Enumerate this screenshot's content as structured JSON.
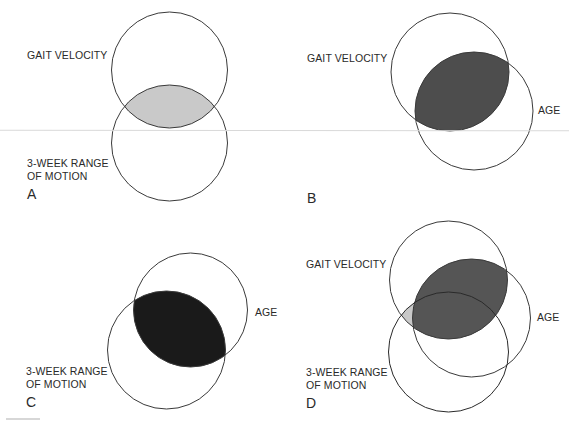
{
  "figure": {
    "panels": [
      {
        "id": "A",
        "letter": "A",
        "labels": {
          "top": "GAIT VELOCITY",
          "bottom_line1": "3-WEEK RANGE",
          "bottom_line2": "OF MOTION"
        },
        "circles": [
          {
            "name": "gait-velocity",
            "cx": 169.5,
            "cy": 70,
            "r": 58
          },
          {
            "name": "3-week-range-of-motion",
            "cx": 169.5,
            "cy": 143,
            "r": 58
          }
        ],
        "shaded_region": "gait-velocity ∩ 3-week-range-of-motion",
        "shade_color": "#c9c9c9"
      },
      {
        "id": "B",
        "letter": "B",
        "labels": {
          "top": "GAIT VELOCITY",
          "right": "AGE"
        },
        "circles": [
          {
            "name": "gait-velocity",
            "cx": 450,
            "cy": 72,
            "r": 59
          },
          {
            "name": "age",
            "cx": 474,
            "cy": 111,
            "r": 59
          }
        ],
        "shaded_region": "gait-velocity ∩ age",
        "shade_color": "#4d4d4d"
      },
      {
        "id": "C",
        "letter": "C",
        "labels": {
          "right": "AGE",
          "bottom_line1": "3-WEEK RANGE",
          "bottom_line2": "OF MOTION"
        },
        "circles": [
          {
            "name": "age",
            "cx": 190.5,
            "cy": 310,
            "r": 57
          },
          {
            "name": "3-week-range-of-motion",
            "cx": 166.5,
            "cy": 350,
            "r": 59
          }
        ],
        "shaded_region": "age ∩ 3-week-range-of-motion",
        "shade_color": "#1a1a1a"
      },
      {
        "id": "D",
        "letter": "D",
        "labels": {
          "top": "GAIT VELOCITY",
          "right": "AGE",
          "bottom_line1": "3-WEEK RANGE",
          "bottom_line2": "OF MOTION"
        },
        "circles": [
          {
            "name": "gait-velocity",
            "cx": 448.5,
            "cy": 280,
            "r": 59
          },
          {
            "name": "age",
            "cx": 471.5,
            "cy": 318,
            "r": 59
          },
          {
            "name": "3-week-range-of-motion",
            "cx": 448.5,
            "cy": 352,
            "r": 60
          }
        ],
        "shaded_regions": [
          {
            "region": "gait-velocity ∩ age",
            "color": "#555555"
          },
          {
            "region": "gait-velocity ∩ 3-week-range-of-motion − age",
            "color": "#c9c9c9"
          }
        ]
      }
    ],
    "colors": {
      "outline": "#3a3a3a",
      "light_shade": "#c9c9c9",
      "medium_shade": "#4d4d4d",
      "dark_shade": "#1a1a1a",
      "d_shade": "#555555"
    }
  }
}
